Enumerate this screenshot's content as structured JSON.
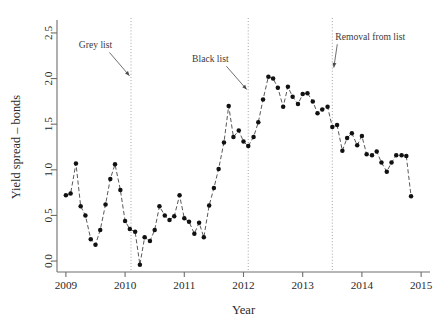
{
  "chart_data": {
    "type": "scatter",
    "title": "",
    "xlabel": "Year",
    "ylabel": "Yield spread – bonds",
    "xlim": [
      2008.85,
      2015.15
    ],
    "ylim": [
      -0.12,
      2.62
    ],
    "xticks": [
      2009,
      2010,
      2011,
      2012,
      2013,
      2014,
      2015
    ],
    "xtick_labels": [
      "2009",
      "2010",
      "2011",
      "2012",
      "2013",
      "2014",
      "2015"
    ],
    "yticks": [
      0.0,
      0.5,
      1.0,
      1.5,
      2.0,
      2.5
    ],
    "ytick_labels": [
      "0.0",
      "0.5",
      "1.0",
      "1.5",
      "2.0",
      "2.5"
    ],
    "grid": false,
    "legend": null,
    "marker": "filled-circle",
    "line_style": "dashed",
    "series": [
      {
        "name": "Yield spread – bonds",
        "x": [
          2009.0,
          2009.08,
          2009.17,
          2009.25,
          2009.33,
          2009.42,
          2009.5,
          2009.58,
          2009.67,
          2009.75,
          2009.83,
          2009.92,
          2010.0,
          2010.08,
          2010.17,
          2010.25,
          2010.33,
          2010.42,
          2010.5,
          2010.58,
          2010.67,
          2010.75,
          2010.83,
          2010.92,
          2011.0,
          2011.08,
          2011.17,
          2011.25,
          2011.33,
          2011.42,
          2011.5,
          2011.58,
          2011.67,
          2011.75,
          2011.83,
          2011.92,
          2012.0,
          2012.08,
          2012.17,
          2012.25,
          2012.33,
          2012.42,
          2012.5,
          2012.58,
          2012.67,
          2012.75,
          2012.83,
          2012.92,
          2013.0,
          2013.08,
          2013.17,
          2013.25,
          2013.33,
          2013.42,
          2013.5,
          2013.58,
          2013.67,
          2013.75,
          2013.83,
          2013.92,
          2014.0,
          2014.08,
          2014.17,
          2014.25,
          2014.33,
          2014.42,
          2014.5,
          2014.58,
          2014.67,
          2014.75,
          2014.83
        ],
        "values": [
          0.72,
          0.74,
          1.07,
          0.6,
          0.5,
          0.24,
          0.18,
          0.34,
          0.62,
          0.9,
          1.06,
          0.78,
          0.44,
          0.35,
          0.32,
          -0.04,
          0.26,
          0.22,
          0.34,
          0.6,
          0.5,
          0.45,
          0.49,
          0.72,
          0.47,
          0.43,
          0.3,
          0.42,
          0.26,
          0.61,
          0.8,
          1.01,
          1.3,
          1.7,
          1.36,
          1.43,
          1.31,
          1.26,
          1.36,
          1.52,
          1.77,
          2.02,
          2.0,
          1.9,
          1.69,
          1.91,
          1.8,
          1.72,
          1.83,
          1.84,
          1.75,
          1.62,
          1.66,
          1.69,
          1.47,
          1.49,
          1.21,
          1.35,
          1.4,
          1.27,
          1.37,
          1.17,
          1.16,
          1.2,
          1.08,
          0.98,
          1.08,
          1.16,
          1.16,
          1.15,
          0.71
        ]
      }
    ],
    "events": [
      {
        "label": "Grey list",
        "x": 2010.1,
        "text_x": 2009.5,
        "text_y": 2.33
      },
      {
        "label": "Black list",
        "x": 2012.08,
        "text_x": 2011.44,
        "text_y": 2.18
      },
      {
        "label": "Removal from list",
        "x": 2013.5,
        "text_x": 2013.55,
        "text_y": 2.42
      }
    ]
  }
}
